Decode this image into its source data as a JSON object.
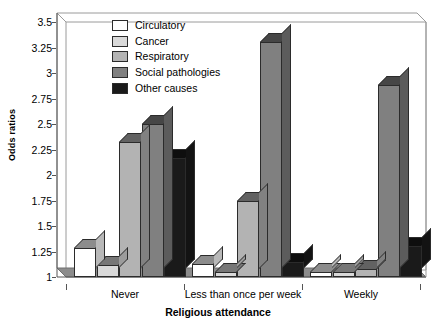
{
  "chart_data": {
    "type": "bar",
    "title": "",
    "xlabel": "Religious attendance",
    "ylabel": "Odds ratios",
    "categories": [
      "Never",
      "Less than once per week",
      "Weekly"
    ],
    "yticks": [
      "1",
      "1.25",
      "1.5",
      "1.75",
      "2",
      "2.25",
      "2.5",
      "2.75",
      "3",
      "3.25",
      "3.5"
    ],
    "ytick_values": [
      1,
      1.25,
      1.5,
      1.75,
      2,
      2.25,
      2.5,
      2.75,
      3,
      3.25,
      3.5
    ],
    "ylim": [
      1,
      3.5
    ],
    "grid": false,
    "legend_position": "top-center",
    "three_d": true,
    "series": [
      {
        "name": "Circulatory",
        "color": "#ffffff",
        "values": [
          1.28,
          1.13,
          1.05
        ]
      },
      {
        "name": "Cancer",
        "color": "#d9d9d9",
        "values": [
          1.12,
          1.05,
          1.05
        ]
      },
      {
        "name": "Respiratory",
        "color": "#b3b3b3",
        "values": [
          2.32,
          1.75,
          1.08
        ]
      },
      {
        "name": "Social pathologies",
        "color": "#808080",
        "values": [
          2.5,
          3.3,
          2.88
        ]
      },
      {
        "name": "Other causes",
        "color": "#1a1a1a",
        "values": [
          2.17,
          1.15,
          1.3
        ]
      }
    ]
  },
  "colors": {
    "floor": "#8c8c8c",
    "frame": "#8a8a8a",
    "bar_outline": "#2b2b2b",
    "background": "#ffffff"
  }
}
